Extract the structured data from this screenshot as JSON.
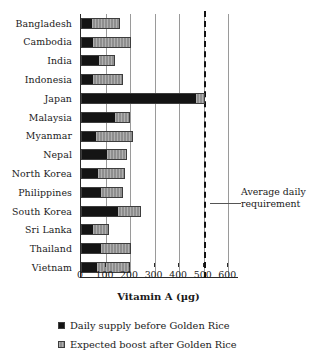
{
  "chart_data": {
    "type": "bar",
    "orientation": "horizontal",
    "stacked": true,
    "title": "",
    "xlabel": "Vitamin A (µg)",
    "ylabel": "",
    "xlim": [
      0,
      640
    ],
    "xticks": [
      0,
      100,
      200,
      300,
      400,
      500,
      600
    ],
    "xticklabels": [
      "0",
      "100",
      "200",
      "300",
      "400",
      "500",
      "600"
    ],
    "grid": "vertical",
    "legend_position": "below",
    "categories": [
      "Bangladesh",
      "Cambodia",
      "India",
      "Indonesia",
      "Japan",
      "Malaysia",
      "Myanmar",
      "Nepal",
      "North Korea",
      "Philippines",
      "South Korea",
      "Sri Lanka",
      "Thailand",
      "Vietnam"
    ],
    "series": [
      {
        "name": "Daily supply before Golden Rice",
        "color": "#141414",
        "values": [
          45,
          45,
          75,
          45,
          472,
          140,
          58,
          105,
          70,
          82,
          152,
          48,
          82,
          63
        ]
      },
      {
        "name": "Expected boost after Golden Rice",
        "color": "#8e8e8e",
        "values": [
          115,
          160,
          65,
          125,
          33,
          58,
          152,
          81,
          108,
          88,
          93,
          65,
          123,
          137
        ]
      }
    ],
    "totals": [
      160,
      205,
      140,
      170,
      505,
      198,
      210,
      186,
      178,
      170,
      245,
      113,
      205,
      200
    ],
    "annotations": [
      {
        "name": "average-daily-requirement",
        "text": "Average daily requirement",
        "line_value": 500,
        "line_style": "dashed",
        "line_color": "#111111"
      }
    ]
  },
  "axis": {
    "x_title": "Vitamin A (µg)",
    "tick_labels": [
      "0",
      "100",
      "200",
      "300",
      "400",
      "500",
      "600"
    ]
  },
  "annotation": {
    "line1": "Average daily",
    "line2": "requirement"
  },
  "legend": {
    "items": [
      {
        "label": "Daily supply before Golden Rice",
        "swatch": "legend-swatch-black"
      },
      {
        "label": "Expected boost after Golden Rice",
        "swatch": "legend-swatch-gray"
      }
    ]
  }
}
